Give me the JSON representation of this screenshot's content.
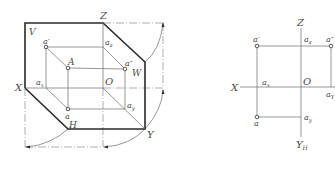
{
  "left_diagram": {
    "title": "Three-plane projection (axonometric)",
    "planes": {
      "v": "V",
      "w": "W",
      "h": "H"
    },
    "axes": {
      "x": "X",
      "y": "Y",
      "z": "Z",
      "origin": "O"
    },
    "points": {
      "space_point": "A",
      "front_projection": "a′",
      "side_projection": "a″",
      "top_projection": "a",
      "ax": "a",
      "ax_sub": "x",
      "az": "a",
      "az_sub": "z",
      "ay": "a",
      "ay_sub": "y"
    }
  },
  "right_diagram": {
    "title": "Unfolded orthographic projection",
    "axes": {
      "x": "X",
      "z": "Z",
      "origin": "O",
      "yh": "Y",
      "yh_sub": "H",
      "yw": "Y"
    },
    "points": {
      "front_projection": "a′",
      "side_projection": "a″",
      "top_projection": "a",
      "ax": "a",
      "ax_sub": "x",
      "az": "a",
      "az_sub": "z",
      "ay": "a",
      "ay_sub": "y",
      "ayw": "a",
      "ayw_sub": "Y"
    }
  }
}
